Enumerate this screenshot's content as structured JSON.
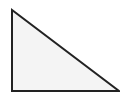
{
  "diagram": {
    "shape": "right-triangle",
    "vertices": [
      [
        12,
        10
      ],
      [
        12,
        91
      ],
      [
        119,
        91
      ]
    ],
    "fill": "#f4f4f4",
    "stroke": "#222222",
    "stroke_width": 2
  }
}
